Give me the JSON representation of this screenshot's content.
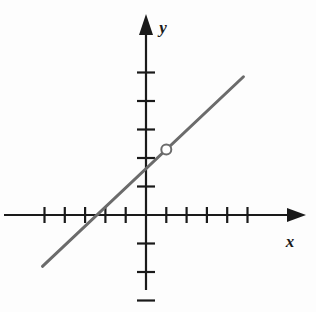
{
  "figure": {
    "kind": "coordinate-plane-line-graph",
    "background_color": "#fdfdfd",
    "axis_color": "#1a1a1a",
    "line_color": "#6b6b6b",
    "marker_fill": "#ffffff"
  },
  "axes": {
    "x_label": "x",
    "y_label": "y",
    "origin_px": {
      "x": 146,
      "y": 215
    },
    "x_unit_px": 20.3,
    "y_unit_px": 28.5,
    "x_axis": {
      "start_px": 4,
      "end_px": 300,
      "arrow": "right",
      "tick_units": [
        -5,
        -4,
        -3,
        -2,
        -1,
        1,
        2,
        3,
        4,
        5
      ],
      "tick_half_length_px": 8
    },
    "y_axis": {
      "start_px": 290,
      "end_px": 20,
      "arrow": "up",
      "tick_units": [
        -3,
        -2,
        -1,
        1,
        2,
        3,
        4,
        5
      ],
      "tick_half_length_px": 9
    }
  },
  "chart_data": {
    "type": "line",
    "title": "",
    "xlabel": "x",
    "ylabel": "y",
    "xlim": [
      -7,
      7.6
    ],
    "ylim": [
      -3.4,
      6.8
    ],
    "grid": false,
    "legend": null,
    "series": [
      {
        "name": "line",
        "style": "solid",
        "color": "#6b6b6b",
        "slope": 0.8,
        "y_intercept": 1.4,
        "x_intercept": -3,
        "endpoints": [
          {
            "x": -5.1,
            "y": -1.8
          },
          {
            "x": 4.8,
            "y": 4.85
          }
        ]
      }
    ],
    "points": [
      {
        "name": "open-point",
        "x": 1,
        "y": 2.3,
        "marker": "open-circle",
        "radius_px": 5
      }
    ]
  }
}
